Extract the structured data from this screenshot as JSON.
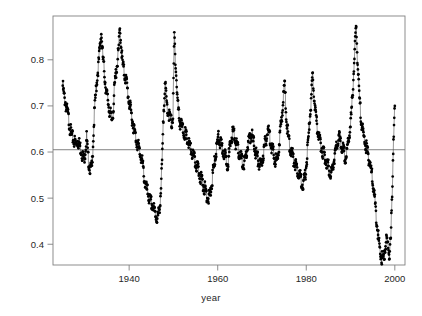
{
  "figure": {
    "background": "#ffffff",
    "point_color": "#000000",
    "line_color": "#4d4d4d",
    "frame_color": "#808080",
    "hline_color": "#737373"
  },
  "axes": {
    "x_title": "year",
    "y_title": "rho(t)",
    "x_ticks": [
      "1940",
      "1960",
      "1980",
      "2000"
    ],
    "y_ticks": [
      "0.4",
      "0.5",
      "0.6",
      "0.7",
      "0.8"
    ]
  },
  "chart_data": {
    "type": "line",
    "title": "",
    "xlabel": "year",
    "ylabel": "rho(t)",
    "xlim": [
      1922.8,
      2002.3
    ],
    "ylim": [
      0.355,
      0.895
    ],
    "x_ticks": [
      1940,
      1960,
      1980,
      2000
    ],
    "y_ticks": [
      0.4,
      0.5,
      0.6,
      0.7,
      0.8
    ],
    "grid": false,
    "legend": null,
    "markers": "filled-circle",
    "reference_lines": [
      {
        "orientation": "horizontal",
        "y": 0.605
      }
    ],
    "series": [
      {
        "name": "rho(t)",
        "x": [
          1925.0,
          1925.3,
          1925.6,
          1925.9,
          1926.2,
          1926.5,
          1926.8,
          1927.1,
          1927.4,
          1927.7,
          1928.0,
          1928.3,
          1928.6,
          1928.9,
          1929.2,
          1929.5,
          1929.8,
          1930.1,
          1930.4,
          1930.7,
          1931.0,
          1931.3,
          1931.6,
          1931.9,
          1932.2,
          1932.5,
          1932.8,
          1933.1,
          1933.4,
          1933.7,
          1934.0,
          1934.3,
          1934.6,
          1934.9,
          1935.2,
          1935.5,
          1935.8,
          1936.1,
          1936.4,
          1936.7,
          1937.0,
          1937.3,
          1937.6,
          1937.9,
          1938.2,
          1938.5,
          1938.8,
          1939.1,
          1939.4,
          1939.7,
          1940.0,
          1940.3,
          1940.6,
          1940.9,
          1941.2,
          1941.5,
          1941.8,
          1942.1,
          1942.4,
          1942.7,
          1943.0,
          1943.3,
          1943.6,
          1943.9,
          1944.2,
          1944.5,
          1944.8,
          1945.1,
          1945.4,
          1945.7,
          1946.0,
          1946.3,
          1946.6,
          1946.9,
          1947.2,
          1947.5,
          1947.8,
          1948.1,
          1948.4,
          1948.7,
          1949.0,
          1949.3,
          1949.6,
          1949.9,
          1950.2,
          1950.5,
          1950.8,
          1951.1,
          1951.4,
          1951.7,
          1952.0,
          1952.3,
          1952.6,
          1952.9,
          1953.2,
          1953.5,
          1953.8,
          1954.1,
          1954.4,
          1954.7,
          1955.0,
          1955.3,
          1955.6,
          1955.9,
          1956.2,
          1956.5,
          1956.8,
          1957.1,
          1957.4,
          1957.7,
          1958.0,
          1958.3,
          1958.6,
          1958.9,
          1959.2,
          1959.5,
          1959.8,
          1960.1,
          1960.4,
          1960.7,
          1961.0,
          1961.3,
          1961.6,
          1961.9,
          1962.2,
          1962.5,
          1962.8,
          1963.1,
          1963.4,
          1963.7,
          1964.0,
          1964.3,
          1964.6,
          1964.9,
          1965.2,
          1965.5,
          1965.8,
          1966.1,
          1966.4,
          1966.7,
          1967.0,
          1967.3,
          1967.6,
          1967.9,
          1968.2,
          1968.5,
          1968.8,
          1969.1,
          1969.4,
          1969.7,
          1970.0,
          1970.3,
          1970.6,
          1970.9,
          1971.2,
          1971.5,
          1971.8,
          1972.1,
          1972.4,
          1972.7,
          1973.0,
          1973.3,
          1973.6,
          1973.9,
          1974.2,
          1974.5,
          1974.8,
          1975.1,
          1975.4,
          1975.7,
          1976.0,
          1976.3,
          1976.6,
          1976.9,
          1977.2,
          1977.5,
          1977.8,
          1978.1,
          1978.4,
          1978.7,
          1979.0,
          1979.3,
          1979.6,
          1979.9,
          1980.2,
          1980.5,
          1980.8,
          1981.1,
          1981.4,
          1981.7,
          1982.0,
          1982.3,
          1982.6,
          1982.9,
          1983.2,
          1983.5,
          1983.8,
          1984.1,
          1984.4,
          1984.7,
          1985.0,
          1985.3,
          1985.6,
          1985.9,
          1986.2,
          1986.5,
          1986.8,
          1987.1,
          1987.4,
          1987.7,
          1988.0,
          1988.3,
          1988.6,
          1988.9,
          1989.2,
          1989.5,
          1989.8,
          1990.1,
          1990.4,
          1990.7,
          1991.0,
          1991.3,
          1991.6,
          1991.9,
          1992.2,
          1992.5,
          1992.8,
          1993.1,
          1993.4,
          1993.7,
          1994.0,
          1994.3,
          1994.6,
          1994.9,
          1995.2,
          1995.5,
          1995.8,
          1996.1,
          1996.4,
          1996.7,
          1997.0,
          1997.3,
          1997.6,
          1997.9,
          1998.2,
          1998.5,
          1998.8,
          1999.1,
          1999.4,
          1999.7,
          2000.0
        ],
        "y": [
          0.752,
          0.728,
          0.716,
          0.7,
          0.688,
          0.668,
          0.652,
          0.64,
          0.636,
          0.63,
          0.624,
          0.634,
          0.628,
          0.62,
          0.612,
          0.6,
          0.592,
          0.612,
          0.64,
          0.596,
          0.58,
          0.57,
          0.575,
          0.64,
          0.7,
          0.74,
          0.772,
          0.8,
          0.836,
          0.868,
          0.82,
          0.79,
          0.76,
          0.735,
          0.72,
          0.7,
          0.688,
          0.676,
          0.7,
          0.748,
          0.778,
          0.8,
          0.828,
          0.872,
          0.84,
          0.8,
          0.784,
          0.772,
          0.76,
          0.736,
          0.716,
          0.7,
          0.684,
          0.668,
          0.652,
          0.64,
          0.628,
          0.62,
          0.608,
          0.596,
          0.584,
          0.56,
          0.54,
          0.528,
          0.52,
          0.508,
          0.5,
          0.496,
          0.488,
          0.48,
          0.472,
          0.464,
          0.47,
          0.49,
          0.53,
          0.6,
          0.7,
          0.76,
          0.72,
          0.7,
          0.69,
          0.68,
          0.67,
          0.686,
          0.862,
          0.8,
          0.74,
          0.7,
          0.676,
          0.668,
          0.66,
          0.652,
          0.648,
          0.64,
          0.632,
          0.624,
          0.616,
          0.608,
          0.6,
          0.592,
          0.584,
          0.576,
          0.568,
          0.56,
          0.552,
          0.544,
          0.536,
          0.528,
          0.52,
          0.512,
          0.508,
          0.516,
          0.534,
          0.56,
          0.58,
          0.6,
          0.62,
          0.64,
          0.632,
          0.624,
          0.616,
          0.608,
          0.6,
          0.592,
          0.584,
          0.596,
          0.62,
          0.64,
          0.652,
          0.648,
          0.632,
          0.62,
          0.612,
          0.604,
          0.596,
          0.588,
          0.58,
          0.588,
          0.6,
          0.616,
          0.628,
          0.64,
          0.648,
          0.636,
          0.624,
          0.612,
          0.6,
          0.592,
          0.584,
          0.576,
          0.588,
          0.604,
          0.62,
          0.636,
          0.648,
          0.656,
          0.64,
          0.624,
          0.612,
          0.6,
          0.592,
          0.584,
          0.6,
          0.628,
          0.66,
          0.69,
          0.72,
          0.76,
          0.7,
          0.66,
          0.636,
          0.62,
          0.608,
          0.6,
          0.592,
          0.584,
          0.576,
          0.568,
          0.56,
          0.552,
          0.544,
          0.536,
          0.548,
          0.568,
          0.6,
          0.64,
          0.68,
          0.72,
          0.77,
          0.74,
          0.7,
          0.672,
          0.656,
          0.64,
          0.628,
          0.616,
          0.608,
          0.6,
          0.592,
          0.584,
          0.576,
          0.568,
          0.56,
          0.572,
          0.588,
          0.604,
          0.616,
          0.628,
          0.64,
          0.632,
          0.62,
          0.612,
          0.604,
          0.596,
          0.608,
          0.628,
          0.652,
          0.68,
          0.72,
          0.78,
          0.84,
          0.876,
          0.8,
          0.74,
          0.7,
          0.672,
          0.652,
          0.636,
          0.624,
          0.612,
          0.6,
          0.588,
          0.572,
          0.552,
          0.528,
          0.5,
          0.47,
          0.44,
          0.412,
          0.392,
          0.38,
          0.372,
          0.388,
          0.404,
          0.42,
          0.4,
          0.388,
          0.42,
          0.52,
          0.64,
          0.7
        ]
      }
    ]
  }
}
